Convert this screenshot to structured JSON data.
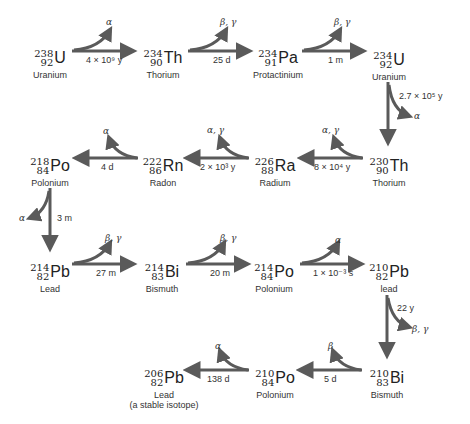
{
  "colors": {
    "arrow": "#5a5a5a",
    "text": "#222222"
  },
  "nuclides": [
    {
      "mass": "238",
      "z": "92",
      "symbol": "U",
      "name": "Uranium"
    },
    {
      "mass": "234",
      "z": "90",
      "symbol": "Th",
      "name": "Thorium"
    },
    {
      "mass": "234",
      "z": "91",
      "symbol": "Pa",
      "name": "Protactinium"
    },
    {
      "mass": "234",
      "z": "92",
      "symbol": "U",
      "name": "Uranium"
    },
    {
      "mass": "230",
      "z": "90",
      "symbol": "Th",
      "name": "Thorium"
    },
    {
      "mass": "226",
      "z": "88",
      "symbol": "Ra",
      "name": "Radium"
    },
    {
      "mass": "222",
      "z": "86",
      "symbol": "Rn",
      "name": "Radon"
    },
    {
      "mass": "218",
      "z": "84",
      "symbol": "Po",
      "name": "Polonium"
    },
    {
      "mass": "214",
      "z": "82",
      "symbol": "Pb",
      "name": "Lead"
    },
    {
      "mass": "214",
      "z": "83",
      "symbol": "Bi",
      "name": "Bismuth"
    },
    {
      "mass": "214",
      "z": "84",
      "symbol": "Po",
      "name": "Polonium"
    },
    {
      "mass": "210",
      "z": "82",
      "symbol": "Pb",
      "name": "lead"
    },
    {
      "mass": "210",
      "z": "83",
      "symbol": "Bi",
      "name": "Bismuth"
    },
    {
      "mass": "210",
      "z": "84",
      "symbol": "Po",
      "name": "Polonium"
    },
    {
      "mass": "206",
      "z": "82",
      "symbol": "Pb",
      "name": "Lead",
      "note": "(a stable isotope)"
    }
  ],
  "decays": [
    {
      "from": "U-238",
      "to": "Th-234",
      "half_life": "4 × 10⁹ y",
      "emission": "α"
    },
    {
      "from": "Th-234",
      "to": "Pa-234",
      "half_life": "25 d",
      "emission": "β, γ"
    },
    {
      "from": "Pa-234",
      "to": "U-234",
      "half_life": "1 m",
      "emission": "β, γ"
    },
    {
      "from": "U-234",
      "to": "Th-230",
      "half_life": "2.7 × 10⁵ y",
      "emission": "α"
    },
    {
      "from": "Th-230",
      "to": "Ra-226",
      "half_life": "8 × 10⁴ y",
      "emission": "α, γ"
    },
    {
      "from": "Ra-226",
      "to": "Rn-222",
      "half_life": "2 × 10³ y",
      "emission": "α, γ"
    },
    {
      "from": "Rn-222",
      "to": "Po-218",
      "half_life": "4 d",
      "emission": "α"
    },
    {
      "from": "Po-218",
      "to": "Pb-214",
      "half_life": "3 m",
      "emission": "α"
    },
    {
      "from": "Pb-214",
      "to": "Bi-214",
      "half_life": "27 m",
      "emission": "β, γ"
    },
    {
      "from": "Bi-214",
      "to": "Po-214",
      "half_life": "20 m",
      "emission": "β, γ"
    },
    {
      "from": "Po-214",
      "to": "Pb-210",
      "half_life": "1 × 10⁻³ s",
      "emission": "α"
    },
    {
      "from": "Pb-210",
      "to": "Bi-210",
      "half_life": "22 y",
      "emission": "β, γ"
    },
    {
      "from": "Bi-210",
      "to": "Po-210",
      "half_life": "5 d",
      "emission": "β"
    },
    {
      "from": "Po-210",
      "to": "Pb-206",
      "half_life": "138 d",
      "emission": "α"
    }
  ]
}
